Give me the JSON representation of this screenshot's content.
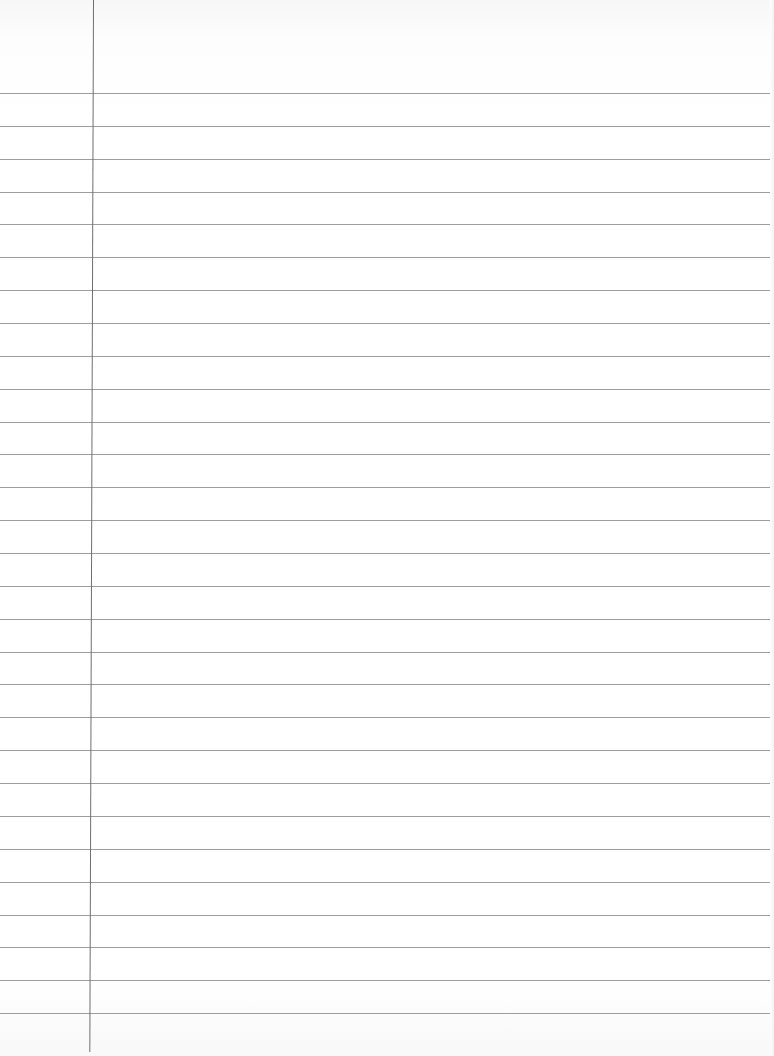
{
  "document": {
    "type": "lined-notebook-paper",
    "content_text": "",
    "ruled_lines": {
      "count": 29,
      "first_y": 93,
      "spacing_px": 32.86,
      "color": "#8c8c8c"
    },
    "margin_line": {
      "x": 93,
      "color": "#6f6f6f"
    },
    "background_color": "#ffffff"
  }
}
